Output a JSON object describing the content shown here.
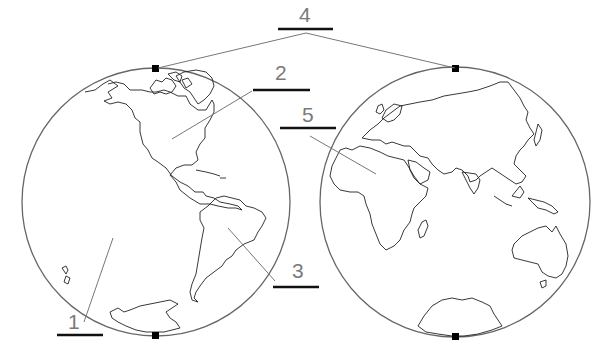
{
  "colors": {
    "background": "#ffffff",
    "outline": "#666666",
    "coastline": "#222222",
    "label_text": "#7a7a7a",
    "blank_line": "#111111"
  },
  "hemispheres": [
    {
      "name": "Western Hemisphere",
      "features": [
        "North America",
        "South America",
        "Antarctica",
        "Pacific Ocean",
        "Greenland"
      ]
    },
    {
      "name": "Eastern Hemisphere",
      "features": [
        "Europe",
        "Asia",
        "Africa",
        "Australia",
        "Antarctica",
        "Indian Ocean"
      ]
    }
  ],
  "labels": [
    {
      "number": "1",
      "points_to": "Pacific Ocean (western hemisphere)"
    },
    {
      "number": "2",
      "points_to": "North America"
    },
    {
      "number": "3",
      "points_to": "South America"
    },
    {
      "number": "4",
      "points_to": "North poles of both hemispheres"
    },
    {
      "number": "5",
      "points_to": "Africa"
    }
  ],
  "pole_markers": [
    "left-top",
    "left-bottom",
    "right-top",
    "right-bottom"
  ]
}
